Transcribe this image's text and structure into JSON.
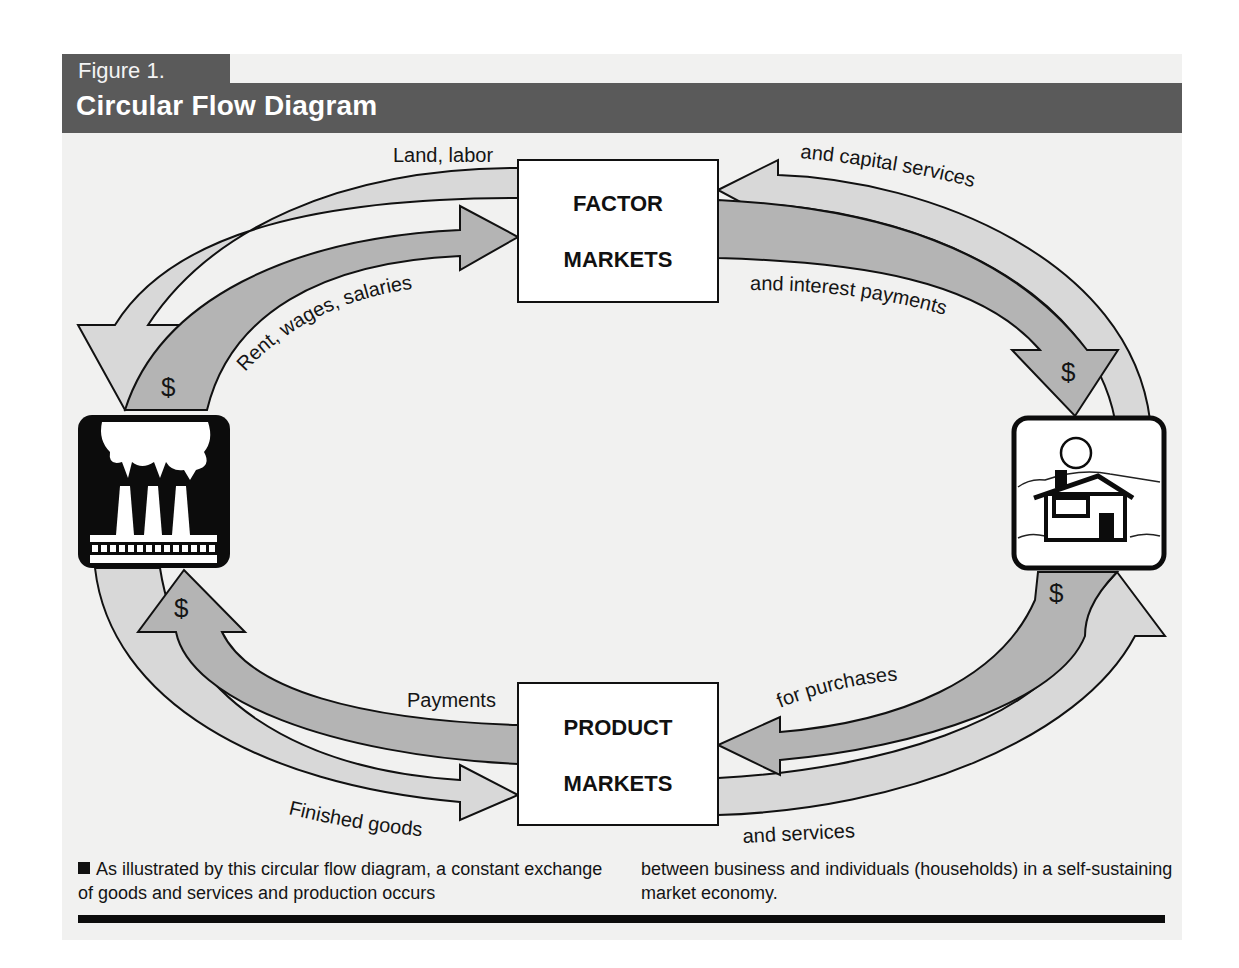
{
  "header": {
    "figure_label": "Figure 1.",
    "title": "Circular Flow Diagram"
  },
  "colors": {
    "title_bar": "#5a5a5a",
    "arrow_light": "#d6d6d6",
    "arrow_dark": "#b4b4b4",
    "page_bg": "#f1f1f0"
  },
  "nodes": {
    "factor_markets": {
      "line1": "FACTOR",
      "line2": "MARKETS"
    },
    "product_markets": {
      "line1": "PRODUCT",
      "line2": "MARKETS"
    },
    "business": {
      "icon": "factory-icon"
    },
    "households": {
      "icon": "house-icon"
    }
  },
  "flows": {
    "land_labor": "Land, labor",
    "capital_services": "and capital services",
    "rent_wages": "Rent, wages, salaries",
    "interest_payments": "and interest payments",
    "payments": "Payments",
    "for_purchases": "for purchases",
    "finished_goods": "Finished  goods",
    "and_services": "and services",
    "dollar": "$"
  },
  "caption": {
    "left": "As illustrated by this circular flow diagram, a constant exchange of goods and services and production occurs",
    "right": "between business and individuals (households) in a self-sustaining market economy."
  }
}
